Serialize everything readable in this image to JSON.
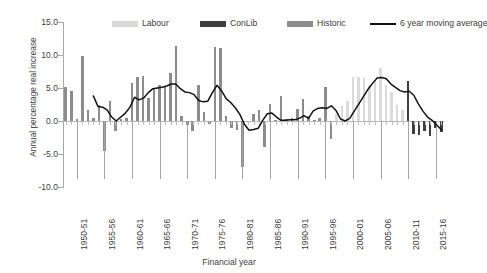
{
  "chart_data": {
    "type": "bar",
    "title": "",
    "xlabel": "Financial year",
    "ylabel": "Annual percentage real increase",
    "ylim": [
      -10.0,
      15.0
    ],
    "yticks": [
      15.0,
      10.0,
      5.0,
      0.0,
      -5.0,
      -10.0
    ],
    "ytick_labels": [
      "15.0",
      "10.0",
      "5.0",
      "0.0",
      "-5.0",
      "-10.0"
    ],
    "grid": false,
    "legend_position": "top",
    "legend": [
      {
        "label": "Labour",
        "type": "bar",
        "color": "#d9d9d9"
      },
      {
        "label": "ConLib",
        "type": "bar",
        "color": "#3f3f3f"
      },
      {
        "label": "Historic",
        "type": "bar",
        "color": "#8c8c8c"
      },
      {
        "label": "6 year moving average",
        "type": "line",
        "color": "#111111"
      }
    ],
    "categories": [
      "1948-49",
      "1949-50",
      "1950-51",
      "1951-52",
      "1952-53",
      "1953-54",
      "1954-55",
      "1955-56",
      "1956-57",
      "1957-58",
      "1958-59",
      "1959-60",
      "1960-61",
      "1961-62",
      "1962-63",
      "1963-64",
      "1964-65",
      "1965-66",
      "1966-67",
      "1967-68",
      "1968-69",
      "1969-70",
      "1970-71",
      "1971-72",
      "1972-73",
      "1973-74",
      "1974-75",
      "1975-76",
      "1976-77",
      "1977-78",
      "1978-79",
      "1979-80",
      "1980-81",
      "1981-82",
      "1982-83",
      "1983-84",
      "1984-85",
      "1985-86",
      "1986-87",
      "1987-88",
      "1988-89",
      "1989-90",
      "1990-91",
      "1991-92",
      "1992-93",
      "1993-94",
      "1994-95",
      "1995-96",
      "1996-97",
      "1997-98",
      "1998-99",
      "1999-00",
      "2000-01",
      "2001-02",
      "2002-03",
      "2003-04",
      "2004-05",
      "2005-06",
      "2006-07",
      "2007-08",
      "2008-09",
      "2009-10",
      "2010-11",
      "2011-12",
      "2012-13",
      "2013-14",
      "2014-15",
      "2015-16",
      "2016-17"
    ],
    "xtick_labels": [
      "1950-51",
      "1955-56",
      "1960-61",
      "1965-66",
      "1970-71",
      "1975-76",
      "1980-81",
      "1985-86",
      "1990-91",
      "1995-96",
      "2000-01",
      "2005-06",
      "2010-11",
      "2015-16"
    ],
    "xtick_indices": [
      2,
      7,
      12,
      17,
      22,
      27,
      32,
      37,
      42,
      47,
      52,
      57,
      62,
      67
    ],
    "values": [
      5.1,
      4.6,
      0.3,
      9.9,
      1.6,
      0.4,
      2.4,
      -4.5,
      3.1,
      -1.5,
      0.3,
      0.5,
      5.8,
      6.6,
      6.8,
      3.5,
      5.0,
      5.4,
      5.3,
      7.3,
      11.4,
      0.8,
      -0.6,
      -1.5,
      5.5,
      1.3,
      -0.5,
      11.2,
      11.0,
      0.7,
      -1.0,
      -1.3,
      -7.0,
      -0.2,
      1.1,
      1.6,
      -3.9,
      2.6,
      0.2,
      3.8,
      0.3,
      0.4,
      1.8,
      3.4,
      0.8,
      0.2,
      0.5,
      5.1,
      -2.8,
      1.0,
      2.2,
      3.0,
      6.6,
      6.7,
      6.5,
      5.4,
      6.0,
      8.1,
      5.4,
      4.4,
      2.5,
      1.6,
      6.0,
      -2.0,
      -2.1,
      -1.5,
      -2.3,
      -1.0,
      -1.6
    ],
    "series_groups": [
      {
        "name": "Historic",
        "color": "#8c8c8c",
        "from": 0,
        "to": 48
      },
      {
        "name": "Labour",
        "color": "#d9d9d9",
        "from": 49,
        "to": 61
      },
      {
        "name": "ConLib",
        "color": "#3f3f3f",
        "from": 62,
        "to": 68
      }
    ],
    "moving_average": {
      "name": "6 year moving average",
      "color": "#111111",
      "start_index": 5,
      "values": [
        3.8,
        2.2,
        2.1,
        1.7,
        0.6,
        0.0,
        0.6,
        1.2,
        2.1,
        3.6,
        3.2,
        3.5,
        4.3,
        4.9,
        5.0,
        5.1,
        5.3,
        5.6,
        5.6,
        4.9,
        4.4,
        4.3,
        4.0,
        3.1,
        2.9,
        3.0,
        4.3,
        5.4,
        4.6,
        3.4,
        2.8,
        2.0,
        1.0,
        -0.5,
        -1.4,
        -1.3,
        -1.1,
        0.1,
        1.1,
        1.2,
        0.6,
        0.1,
        0.1,
        0.2,
        0.2,
        0.4,
        0.8,
        0.4,
        1.5,
        1.9,
        2.0,
        1.9,
        2.3,
        1.6,
        0.3,
        0.0,
        0.4,
        1.5,
        2.6,
        3.7,
        4.8,
        5.7,
        6.5,
        6.6,
        6.4,
        5.6,
        5.1,
        4.6,
        4.4,
        4.5,
        3.9,
        2.6,
        1.5,
        0.6,
        0.1,
        -0.6,
        -1.3
      ]
    }
  }
}
